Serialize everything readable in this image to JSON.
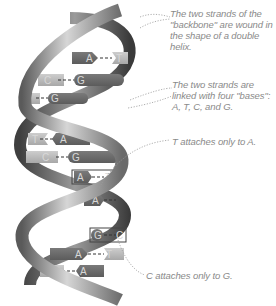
{
  "diagram": {
    "type": "dna-double-helix",
    "colors": {
      "background": "#ffffff",
      "strand_dark": "#4a4a4a",
      "strand_mid": "#8a8a8a",
      "strand_light": "#cfcfcf",
      "base_dark": "#6e6e6e",
      "base_light": "#bdbdbd",
      "annotation_text": "#8a8a8a",
      "leader_line": "#9a9a9a"
    },
    "annotations": [
      {
        "id": "backbone",
        "text": "The two strands of the \"backbone\" are wound in the shape of a double helix."
      },
      {
        "id": "bases",
        "text": "The two strands are linked with four \"bases\": A, T, C, and G."
      },
      {
        "id": "t-a",
        "text": "T attaches only to A."
      },
      {
        "id": "c-g",
        "text": "C attaches only to G."
      }
    ],
    "base_pairs": [
      {
        "left": "C",
        "right": "",
        "note": "partial pair at top"
      },
      {
        "left": "A",
        "right": "T"
      },
      {
        "left": "C",
        "right": "G"
      },
      {
        "left": "C",
        "right": "G"
      },
      {
        "left": "T",
        "right": "A"
      },
      {
        "left": "C",
        "right": "G"
      },
      {
        "left": "A",
        "right": "T"
      },
      {
        "left": "A",
        "right": "T"
      },
      {
        "left": "G",
        "right": "C"
      },
      {
        "left": "A",
        "right": "T"
      },
      {
        "left": "T",
        "right": "A"
      }
    ]
  }
}
